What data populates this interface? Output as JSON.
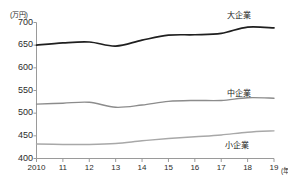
{
  "chart_data": {
    "type": "line",
    "title": "",
    "xlabel": "(年)",
    "ylabel": "(万円)",
    "unit_label": "(万円)",
    "x_unit_label": "(年)",
    "grid": false,
    "legend_position": "right-inline",
    "xlim": [
      2010,
      2019
    ],
    "ylim": [
      400,
      700
    ],
    "ytick_step": 50,
    "categories": [
      "2010",
      "11",
      "12",
      "13",
      "14",
      "15",
      "16",
      "17",
      "18",
      "19"
    ],
    "x": [
      2010,
      2011,
      2012,
      2013,
      2014,
      2015,
      2016,
      2017,
      2018,
      2019
    ],
    "yticks": [
      "700",
      "650",
      "600",
      "550",
      "500",
      "450",
      "400"
    ],
    "ytick_values": [
      700,
      650,
      600,
      550,
      500,
      450,
      400
    ],
    "series": [
      {
        "name": "大企業",
        "color": "#1f1f1f",
        "width": 1.7,
        "values": [
          650,
          655,
          657,
          648,
          661,
          672,
          673,
          676,
          690,
          688
        ]
      },
      {
        "name": "中企業",
        "color": "#8c8c8c",
        "width": 1.4,
        "values": [
          520,
          522,
          524,
          513,
          518,
          526,
          528,
          528,
          534,
          533
        ]
      },
      {
        "name": "小企業",
        "color": "#a8a8a8",
        "width": 1.4,
        "values": [
          432,
          431,
          431,
          433,
          439,
          444,
          448,
          452,
          458,
          461
        ]
      }
    ]
  },
  "axis": {
    "unit": "(万円)",
    "x_unit": "(年)"
  }
}
